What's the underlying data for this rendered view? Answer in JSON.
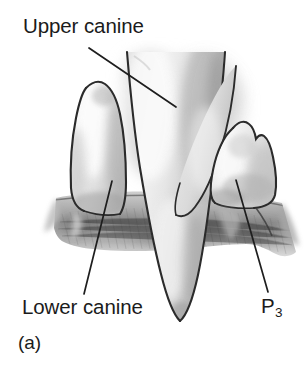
{
  "figure": {
    "caption": "(a)",
    "background_color": "#ffffff",
    "text_color": "#1b1b1b",
    "labels": [
      {
        "id": "upper-canine",
        "text": "Upper canine",
        "leader_line": {
          "x1": 89,
          "y1": 48,
          "x2": 176,
          "y2": 107
        }
      },
      {
        "id": "lower-canine",
        "text": "Lower canine",
        "leader_line": {
          "x1": 112,
          "y1": 181,
          "x2": 84,
          "y2": 294
        }
      },
      {
        "id": "p3",
        "text": "P",
        "subscript": "3",
        "leader_line": {
          "x1": 236,
          "y1": 180,
          "x2": 268,
          "y2": 292
        }
      }
    ],
    "drawing_colors": {
      "outline": "#2b2b2b",
      "enamel_light": "#f4f4f4",
      "enamel_mid": "#dcdcdc",
      "enamel_shadow": "#b9b9b9",
      "gum_light": "#c9c9c9",
      "gum_mid": "#a0a0a0",
      "gum_dark": "#6e6e6e"
    }
  }
}
